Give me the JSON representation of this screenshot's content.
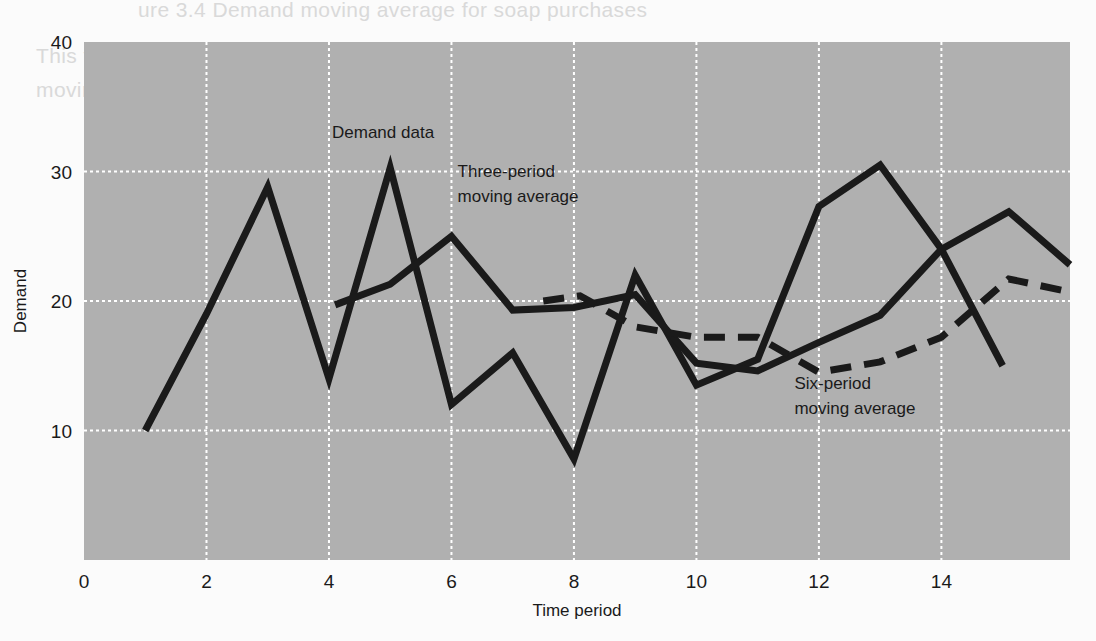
{
  "figure": {
    "background_color": "#fbfbfb",
    "plot_background_color": "#b0b0b0",
    "grid_color": "#ffffff",
    "line_color": "#1a1a1a"
  },
  "bleed_text": {
    "line1": "ure 3.4  Demand moving average for soap purchases",
    "line2": "This figure shows the demand data with three-period and six-period",
    "line3": "moving averages superimposed over the raw demand values.",
    "line4": ""
  },
  "chart_data": {
    "type": "line",
    "title": "",
    "xlabel": "Time period",
    "ylabel": "Demand",
    "xlim": [
      0,
      16.1
    ],
    "ylim": [
      0,
      40
    ],
    "xticks": [
      0,
      2,
      4,
      6,
      8,
      10,
      12,
      14
    ],
    "xtick_labels": [
      "0",
      "2",
      "4",
      "6",
      "8",
      "10",
      "12",
      "14"
    ],
    "yticks": [
      10,
      20,
      30,
      40
    ],
    "ytick_labels": [
      "10",
      "20",
      "30",
      "40"
    ],
    "grid": true,
    "grid_style": "dotted-white",
    "legend": "inline-annotations",
    "series": [
      {
        "name": "Demand data",
        "style": "solid",
        "x": [
          1,
          2,
          3,
          4,
          5,
          6,
          7,
          8,
          9,
          10,
          11,
          12,
          13,
          14,
          15
        ],
        "values": [
          10.0,
          19.0,
          28.8,
          14.0,
          30.3,
          12.0,
          16.0,
          7.8,
          22.0,
          13.5,
          15.5,
          27.3,
          30.5,
          24.0,
          15.0
        ]
      },
      {
        "name": "Three-period moving average",
        "style": "solid",
        "x": [
          4.1,
          5.0,
          6.0,
          7.0,
          8.0,
          9.0,
          10.0,
          11.0,
          12.0,
          13.0,
          14.0,
          15.1,
          16.1
        ],
        "values": [
          19.7,
          21.3,
          25.0,
          19.3,
          19.5,
          20.5,
          15.2,
          14.6,
          16.8,
          18.9,
          24.0,
          26.9,
          22.8
        ]
      },
      {
        "name": "Six-period moving average",
        "style": "dashed",
        "x": [
          7.5,
          8.1,
          9.0,
          10.0,
          11.0,
          12.0,
          13.0,
          14.0,
          15.1,
          16.1
        ],
        "values": [
          20.0,
          20.4,
          18.0,
          17.2,
          17.2,
          14.5,
          15.3,
          17.2,
          21.7,
          20.7
        ]
      }
    ],
    "annotations": [
      {
        "name": "demand-data-label",
        "text": "Demand data",
        "x": 4.05,
        "y": 32.6,
        "align": "start",
        "lines": [
          "Demand data"
        ]
      },
      {
        "name": "three-period-label",
        "text": "Three-period moving average",
        "x": 6.1,
        "y": 29.6,
        "align": "start",
        "lines": [
          "Three-period",
          "moving average"
        ]
      },
      {
        "name": "six-period-label",
        "text": "Six-period moving average",
        "x": 11.6,
        "y": 13.2,
        "align": "start",
        "lines": [
          "Six-period",
          "moving average"
        ]
      }
    ]
  }
}
